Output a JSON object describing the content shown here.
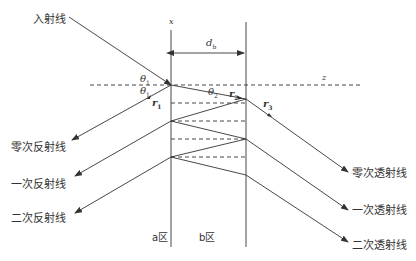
{
  "labels": {
    "incident": "入射线",
    "reflect0": "零次反射线",
    "reflect1": "一次反射线",
    "reflect2": "二次反射线",
    "transmit0": "零次透射线",
    "transmit1": "一次透射线",
    "transmit2": "二次透射线",
    "region_a": "a区",
    "region_b": "b区"
  },
  "symbols": {
    "x_axis": "x",
    "z_axis": "z",
    "thickness": "d",
    "thickness_sub": "b",
    "theta": "θ",
    "theta1_sub": "1",
    "theta2_sub": "2",
    "r": "r",
    "r1_sub": "1",
    "r2_sub": "2",
    "r3_sub": "3"
  },
  "colors": {
    "line": "#333333",
    "text": "#333333",
    "background": "#ffffff"
  }
}
